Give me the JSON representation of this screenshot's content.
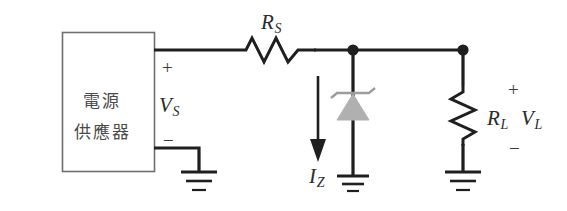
{
  "diagram": {
    "background_color": "#ffffff",
    "wire_color": "#1f1f1f",
    "box_color": "#6e6e6e",
    "zener_fill_color": "#b0b0b0",
    "text_color": "#2b2b2b"
  },
  "source": {
    "line1": "電源",
    "line2": "供應器",
    "plus_sign": "+",
    "minus_sign": "−",
    "voltage_symbol": "V",
    "voltage_subscript": "S"
  },
  "series_resistor": {
    "symbol": "R",
    "subscript": "S"
  },
  "zener": {
    "current_symbol": "I",
    "current_subscript": "Z"
  },
  "load": {
    "resistor_symbol": "R",
    "resistor_subscript": "L",
    "voltage_symbol": "V",
    "voltage_subscript": "L",
    "plus_sign": "+",
    "minus_sign": "−"
  }
}
